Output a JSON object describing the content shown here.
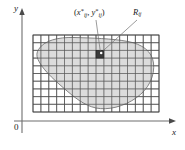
{
  "figure": {
    "name": "double-integral-riemann-sum-region",
    "background_color": "#ffffff",
    "width": 185,
    "height": 150
  },
  "axes": {
    "x_label": "x",
    "y_label": "y",
    "origin_label": "0",
    "axis_color": "#6e6e6e",
    "x_axis": {
      "y_pixel": 121,
      "x_start": 22,
      "x_end": 177
    },
    "y_axis": {
      "x_pixel": 22,
      "y_start": 10,
      "y_end": 133
    }
  },
  "grid": {
    "columns": 16,
    "rows": 10,
    "left": 33,
    "top": 35,
    "right": 159,
    "bottom": 112,
    "cell_width": 7.875,
    "cell_height": 7.7,
    "line_color": "#4d4d4d",
    "frame_color": "#3c3c3c"
  },
  "region": {
    "label": "R",
    "fill_color": "#d2d2d2",
    "stroke_color": "#777777",
    "description": "irregular closed blob region overlapping the grid"
  },
  "sample_cell": {
    "label_prefix": "R",
    "label_sub": "ij",
    "fill_color": "#3a3a3a",
    "x": 96.5,
    "y": 51,
    "width": 7.9,
    "height": 7.7,
    "dot_color": "#ffffff"
  },
  "labels": {
    "sample_point": {
      "open": "(",
      "x_var": "x",
      "x_sub": "ij",
      "x_sup": "*",
      "comma": ", ",
      "y_var": "y",
      "y_sub": "ij",
      "y_sup": "*",
      "close": ")",
      "plain": "(x*ij, y*ij)"
    },
    "subrectangle": {
      "var": "R",
      "sub": "ij",
      "plain": "Rij"
    }
  },
  "leader_lines": [
    {
      "name": "sample-point-leader",
      "x1": 96,
      "y1": 20,
      "x2": 100,
      "y2": 51
    },
    {
      "name": "subrectangle-leader",
      "x1": 136,
      "y1": 20,
      "x2": 104,
      "y2": 51
    }
  ]
}
